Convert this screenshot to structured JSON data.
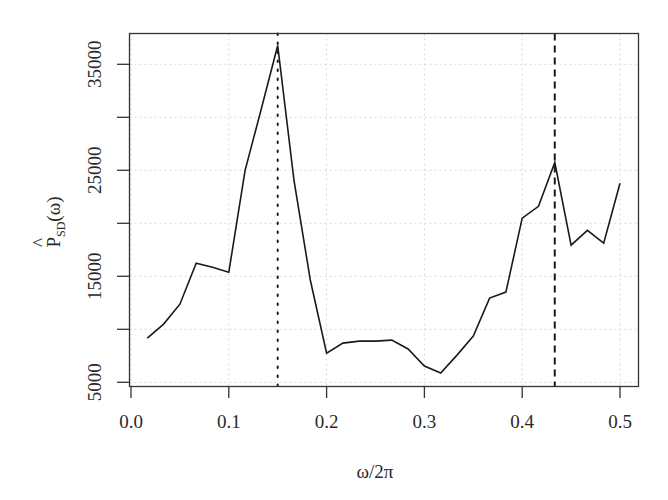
{
  "chart_data": {
    "type": "line",
    "title": "",
    "xlabel": "ω/2π",
    "ylabel": {
      "main": "P",
      "hat": "^",
      "subscript": "SD",
      "suffix": "(ω)"
    },
    "xlim": [
      0.0,
      0.5
    ],
    "ylim": [
      5000,
      36770
    ],
    "x_ticks": [
      0.0,
      0.1,
      0.2,
      0.3,
      0.4,
      0.5
    ],
    "x_tick_labels": [
      "0.0",
      "0.1",
      "0.2",
      "0.3",
      "0.4",
      "0.5"
    ],
    "y_ticks": [
      5000,
      10000,
      15000,
      20000,
      25000,
      30000,
      35000
    ],
    "y_tick_labels": [
      "5000",
      "",
      "15000",
      "",
      "25000",
      "",
      "35000"
    ],
    "grid": true,
    "legend": null,
    "series": [
      {
        "name": "spectral density estimate",
        "style": "solid",
        "color": "#1a1a1a",
        "x": [
          0.0167,
          0.0333,
          0.05,
          0.0667,
          0.0833,
          0.1,
          0.1167,
          0.1333,
          0.15,
          0.1667,
          0.1833,
          0.2,
          0.2167,
          0.2333,
          0.25,
          0.2667,
          0.2833,
          0.3,
          0.3167,
          0.3333,
          0.35,
          0.3667,
          0.3833,
          0.4,
          0.4167,
          0.4333,
          0.45,
          0.4667,
          0.4833,
          0.5
        ],
        "values": [
          9170,
          10490,
          12370,
          16240,
          15860,
          15390,
          25000,
          30830,
          36770,
          24060,
          14650,
          7750,
          8700,
          8890,
          8890,
          8980,
          8140,
          6540,
          5880,
          7570,
          9360,
          12940,
          13510,
          20480,
          21600,
          25740,
          17930,
          19340,
          18120,
          23770
        ]
      }
    ],
    "reference_lines": [
      {
        "name": "dominant-peak-line",
        "x": 0.15,
        "style": "dotted",
        "color": "#1a1a1a"
      },
      {
        "name": "secondary-peak-line",
        "x": 0.4333,
        "style": "dashed",
        "color": "#1a1a1a"
      }
    ]
  }
}
